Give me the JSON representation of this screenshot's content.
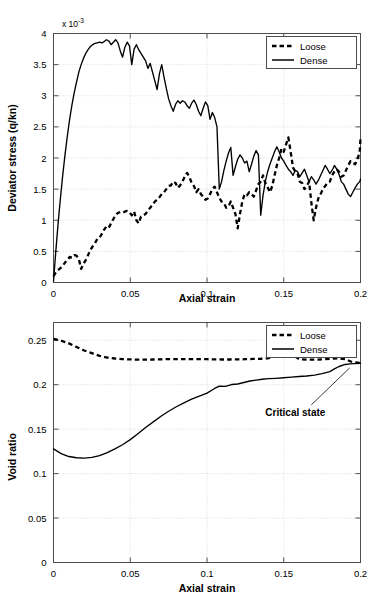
{
  "figure": {
    "title": "",
    "background": "#ffffff",
    "ink_color": "#000000"
  },
  "chart_data": [
    {
      "id": "deviator-stress-vs-axial-strain",
      "type": "line",
      "title": "",
      "xlabel": "Axial strain",
      "ylabel": "Deviator stress (q/kn)",
      "y_exponent_label": "x 10",
      "y_exponent_power": "-3",
      "xlim": [
        0,
        0.2
      ],
      "ylim": [
        0,
        4
      ],
      "xticks": [
        0,
        0.05,
        0.1,
        0.15,
        0.2
      ],
      "xticklabels": [
        "0",
        "0.05",
        "0.1",
        "0.15",
        "0.2"
      ],
      "yticks": [
        0,
        0.5,
        1,
        1.5,
        2,
        2.5,
        3,
        3.5,
        4
      ],
      "yticklabels": [
        "0",
        "0.5",
        "1",
        "1.5",
        "2",
        "2.5",
        "3",
        "3.5",
        "4"
      ],
      "grid": true,
      "legend_position": "top-right",
      "series": [
        {
          "name": "Loose",
          "style": "dashed",
          "x": [
            0,
            0.0015,
            0.003,
            0.0045,
            0.006,
            0.0075,
            0.009,
            0.0105,
            0.012,
            0.0135,
            0.015,
            0.0165,
            0.018,
            0.0195,
            0.021,
            0.0225,
            0.024,
            0.0255,
            0.027,
            0.0285,
            0.03,
            0.0315,
            0.033,
            0.0345,
            0.036,
            0.0375,
            0.039,
            0.0405,
            0.042,
            0.0435,
            0.045,
            0.0465,
            0.048,
            0.0495,
            0.051,
            0.0525,
            0.054,
            0.0555,
            0.057,
            0.0585,
            0.06,
            0.0615,
            0.063,
            0.0645,
            0.066,
            0.0675,
            0.069,
            0.0705,
            0.072,
            0.0735,
            0.075,
            0.0765,
            0.078,
            0.0795,
            0.081,
            0.0825,
            0.084,
            0.0855,
            0.087,
            0.0885,
            0.09,
            0.0915,
            0.093,
            0.0945,
            0.096,
            0.0975,
            0.099,
            0.1005,
            0.102,
            0.1035,
            0.105,
            0.1065,
            0.108,
            0.1095,
            0.111,
            0.1125,
            0.114,
            0.1155,
            0.117,
            0.1185,
            0.12,
            0.1215,
            0.123,
            0.1245,
            0.126,
            0.1275,
            0.129,
            0.1305,
            0.132,
            0.1335,
            0.135,
            0.1365,
            0.138,
            0.1395,
            0.141,
            0.1425,
            0.144,
            0.1455,
            0.147,
            0.1485,
            0.15,
            0.1515,
            0.153,
            0.1545,
            0.156,
            0.1575,
            0.159,
            0.1605,
            0.162,
            0.1635,
            0.165,
            0.1665,
            0.168,
            0.1695,
            0.171,
            0.1725,
            0.174,
            0.1755,
            0.177,
            0.1785,
            0.18,
            0.1815,
            0.183,
            0.1845,
            0.186,
            0.1875,
            0.189,
            0.1905,
            0.192,
            0.1935,
            0.195,
            0.1965,
            0.198,
            0.1995,
            0.2
          ],
          "y": [
            0.1,
            0.16,
            0.2,
            0.23,
            0.27,
            0.32,
            0.36,
            0.41,
            0.4,
            0.44,
            0.43,
            0.38,
            0.22,
            0.3,
            0.36,
            0.44,
            0.52,
            0.58,
            0.63,
            0.7,
            0.72,
            0.78,
            0.85,
            0.9,
            0.88,
            0.95,
            1.02,
            1.08,
            1.12,
            1.13,
            1.12,
            1.14,
            1.15,
            1.13,
            1.08,
            1.14,
            1.0,
            0.95,
            1.06,
            1.08,
            1.1,
            1.16,
            1.2,
            1.25,
            1.3,
            1.33,
            1.37,
            1.42,
            1.45,
            1.5,
            1.55,
            1.56,
            1.62,
            1.6,
            1.52,
            1.56,
            1.62,
            1.7,
            1.76,
            1.7,
            1.6,
            1.55,
            1.45,
            1.5,
            1.42,
            1.38,
            1.33,
            1.35,
            1.42,
            1.5,
            1.54,
            1.45,
            1.36,
            1.3,
            1.28,
            1.2,
            1.22,
            1.3,
            1.2,
            1.1,
            0.87,
            1.1,
            1.3,
            1.42,
            1.4,
            1.45,
            1.42,
            1.38,
            1.48,
            1.58,
            1.62,
            1.72,
            1.6,
            1.53,
            1.45,
            1.55,
            1.72,
            1.88,
            2.0,
            2.15,
            2.1,
            2.22,
            2.33,
            2.1,
            1.85,
            1.78,
            1.75,
            1.62,
            1.6,
            1.5,
            1.55,
            1.62,
            1.28,
            1.0,
            1.2,
            1.35,
            1.42,
            1.5,
            1.55,
            1.6,
            1.62,
            1.72,
            1.78,
            1.82,
            1.78,
            1.7,
            1.72,
            1.8,
            1.88,
            1.95,
            1.92,
            1.9,
            1.98,
            2.1,
            2.32,
            2.56,
            2.35,
            2.25
          ]
        },
        {
          "name": "Dense",
          "style": "solid",
          "x": [
            0,
            0.0015,
            0.003,
            0.0045,
            0.006,
            0.0075,
            0.009,
            0.0105,
            0.012,
            0.0135,
            0.015,
            0.0165,
            0.018,
            0.0195,
            0.021,
            0.0225,
            0.024,
            0.0255,
            0.027,
            0.0285,
            0.03,
            0.0315,
            0.033,
            0.0345,
            0.036,
            0.0375,
            0.039,
            0.0405,
            0.042,
            0.0435,
            0.045,
            0.0465,
            0.048,
            0.0495,
            0.051,
            0.0525,
            0.054,
            0.0555,
            0.057,
            0.0585,
            0.06,
            0.0615,
            0.063,
            0.0645,
            0.066,
            0.0675,
            0.069,
            0.0705,
            0.072,
            0.0735,
            0.075,
            0.0765,
            0.078,
            0.0795,
            0.081,
            0.0825,
            0.084,
            0.0855,
            0.087,
            0.0885,
            0.09,
            0.0915,
            0.093,
            0.0945,
            0.096,
            0.0975,
            0.099,
            0.1005,
            0.102,
            0.1035,
            0.105,
            0.1065,
            0.108,
            0.1095,
            0.111,
            0.1125,
            0.114,
            0.1155,
            0.117,
            0.1185,
            0.12,
            0.1215,
            0.123,
            0.1245,
            0.126,
            0.1275,
            0.129,
            0.1305,
            0.132,
            0.1335,
            0.135,
            0.1365,
            0.138,
            0.1395,
            0.141,
            0.1425,
            0.144,
            0.1455,
            0.147,
            0.1485,
            0.15,
            0.1515,
            0.153,
            0.1545,
            0.156,
            0.1575,
            0.159,
            0.1605,
            0.162,
            0.1635,
            0.165,
            0.1665,
            0.168,
            0.1695,
            0.171,
            0.1725,
            0.174,
            0.1755,
            0.177,
            0.1785,
            0.18,
            0.1815,
            0.183,
            0.1845,
            0.186,
            0.1875,
            0.189,
            0.1905,
            0.192,
            0.1935,
            0.195,
            0.1965,
            0.198,
            0.1995,
            0.2
          ],
          "y": [
            0.02,
            0.5,
            0.95,
            1.35,
            1.72,
            2.05,
            2.35,
            2.62,
            2.85,
            3.05,
            3.22,
            3.38,
            3.5,
            3.6,
            3.68,
            3.74,
            3.79,
            3.82,
            3.84,
            3.85,
            3.86,
            3.85,
            3.87,
            3.9,
            3.88,
            3.82,
            3.86,
            3.9,
            3.85,
            3.72,
            3.62,
            3.78,
            3.86,
            3.8,
            3.5,
            3.75,
            3.82,
            3.74,
            3.68,
            3.62,
            3.56,
            3.44,
            3.52,
            3.38,
            3.24,
            3.1,
            3.35,
            3.5,
            3.3,
            3.12,
            2.95,
            2.84,
            2.75,
            2.86,
            2.92,
            2.88,
            2.92,
            2.9,
            2.84,
            2.8,
            2.88,
            2.93,
            2.86,
            2.75,
            2.68,
            2.8,
            2.9,
            2.84,
            2.62,
            2.73,
            2.65,
            2.5,
            1.5,
            1.62,
            1.8,
            1.95,
            2.08,
            2.17,
            1.72,
            1.86,
            1.98,
            2.05,
            2.0,
            1.92,
            1.95,
            1.78,
            1.9,
            2.03,
            2.12,
            2.05,
            1.08,
            1.4,
            1.62,
            1.78,
            1.9,
            2.0,
            2.1,
            2.18,
            2.1,
            2.0,
            1.95,
            1.88,
            1.82,
            1.78,
            1.72,
            1.8,
            1.78,
            1.7,
            1.76,
            1.82,
            1.72,
            1.62,
            1.7,
            1.65,
            1.58,
            1.64,
            1.72,
            1.8,
            1.88,
            1.82,
            1.75,
            1.8,
            1.88,
            1.82,
            1.74,
            1.62,
            1.58,
            1.5,
            1.42,
            1.38,
            1.45,
            1.52,
            1.58,
            1.62,
            1.66,
            1.68,
            1.66
          ]
        }
      ]
    },
    {
      "id": "void-ratio-vs-axial-strain",
      "type": "line",
      "title": "",
      "xlabel": "Axial strain",
      "ylabel": "Void ratio",
      "xlim": [
        0,
        0.2
      ],
      "ylim": [
        0,
        0.27
      ],
      "xticks": [
        0,
        0.05,
        0.1,
        0.15,
        0.2
      ],
      "xticklabels": [
        "0",
        "0.05",
        "0.1",
        "0.15",
        "0.2"
      ],
      "yticks": [
        0,
        0.05,
        0.1,
        0.15,
        0.2,
        0.25
      ],
      "yticklabels": [
        "0",
        "0.05",
        "0.1",
        "0.15",
        "0.2",
        "0.25"
      ],
      "grid": true,
      "legend_position": "top-right",
      "annotations": [
        {
          "text": "Critical state",
          "x": 0.193,
          "y": 0.2235,
          "label_x": 0.138,
          "label_y": 0.165
        }
      ],
      "series": [
        {
          "name": "Loose",
          "style": "dashed",
          "x": [
            0,
            0.005,
            0.01,
            0.015,
            0.02,
            0.025,
            0.03,
            0.035,
            0.04,
            0.045,
            0.05,
            0.055,
            0.06,
            0.065,
            0.07,
            0.075,
            0.08,
            0.085,
            0.09,
            0.095,
            0.1,
            0.105,
            0.11,
            0.115,
            0.12,
            0.125,
            0.13,
            0.135,
            0.14,
            0.145,
            0.148,
            0.152,
            0.156,
            0.16,
            0.165,
            0.17,
            0.175,
            0.18,
            0.185,
            0.19,
            0.195,
            0.2
          ],
          "y": [
            0.2515,
            0.2495,
            0.2465,
            0.2425,
            0.2385,
            0.2355,
            0.2325,
            0.2305,
            0.2295,
            0.2288,
            0.2285,
            0.2282,
            0.2282,
            0.2284,
            0.2286,
            0.2288,
            0.2288,
            0.2288,
            0.2288,
            0.2287,
            0.2287,
            0.2285,
            0.2284,
            0.2284,
            0.2285,
            0.2287,
            0.229,
            0.2292,
            0.2298,
            0.2325,
            0.2345,
            0.2348,
            0.2335,
            0.2288,
            0.2282,
            0.2282,
            0.2285,
            0.229,
            0.2298,
            0.2288,
            0.2252,
            0.2245
          ]
        },
        {
          "name": "Dense",
          "style": "solid",
          "x": [
            0,
            0.005,
            0.01,
            0.015,
            0.02,
            0.025,
            0.03,
            0.035,
            0.04,
            0.045,
            0.05,
            0.055,
            0.06,
            0.065,
            0.07,
            0.075,
            0.08,
            0.085,
            0.09,
            0.095,
            0.1,
            0.105,
            0.108,
            0.112,
            0.116,
            0.12,
            0.124,
            0.128,
            0.132,
            0.136,
            0.14,
            0.145,
            0.15,
            0.155,
            0.16,
            0.165,
            0.17,
            0.175,
            0.18,
            0.183,
            0.186,
            0.19,
            0.193,
            0.196,
            0.2
          ],
          "y": [
            0.1278,
            0.1225,
            0.1192,
            0.1178,
            0.1175,
            0.1182,
            0.1202,
            0.1235,
            0.1278,
            0.1325,
            0.1382,
            0.1448,
            0.1518,
            0.1582,
            0.1645,
            0.1702,
            0.1752,
            0.1795,
            0.1838,
            0.1872,
            0.1905,
            0.1958,
            0.1985,
            0.1982,
            0.2002,
            0.2008,
            0.2025,
            0.2042,
            0.2052,
            0.2062,
            0.2068,
            0.2072,
            0.2078,
            0.2085,
            0.2092,
            0.2098,
            0.2108,
            0.2125,
            0.2148,
            0.2178,
            0.2205,
            0.2228,
            0.2235,
            0.2238,
            0.2242
          ]
        }
      ]
    }
  ]
}
